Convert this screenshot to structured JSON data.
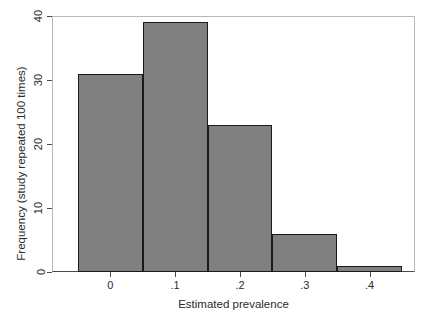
{
  "chart_data": {
    "type": "bar",
    "title": "",
    "subtitle": "",
    "xlabel": "Estimated prevalence",
    "ylabel": "Frequency (study repeated 100 times)",
    "categories": [
      "-0.05 to 0.05",
      "0.05 to 0.15",
      "0.15 to 0.25",
      "0.25 to 0.35",
      "0.35 to 0.45"
    ],
    "bin_edges": [
      -0.05,
      0.05,
      0.15,
      0.25,
      0.35,
      0.45
    ],
    "values": [
      31,
      39,
      23,
      6,
      1
    ],
    "bar_labels": [
      "31",
      "39",
      "23",
      "6",
      "1"
    ],
    "xlim": [
      -0.09,
      0.47
    ],
    "ylim": [
      0,
      40
    ],
    "xticks": [
      0,
      0.1,
      0.2,
      0.3,
      0.4
    ],
    "xtick_labels": [
      "0",
      ".1",
      ".2",
      ".3",
      ".4"
    ],
    "yticks": [
      0,
      10,
      20,
      30,
      40
    ],
    "ytick_labels": [
      "0",
      "10",
      "20",
      "30",
      "40"
    ],
    "grid": false,
    "legend": null,
    "legend_position": "none",
    "bar_fill_color": "#808080",
    "bar_edge_color": "#1a1a1a",
    "background_color": "#ffffff",
    "axis_color": "#4a4a4a"
  }
}
